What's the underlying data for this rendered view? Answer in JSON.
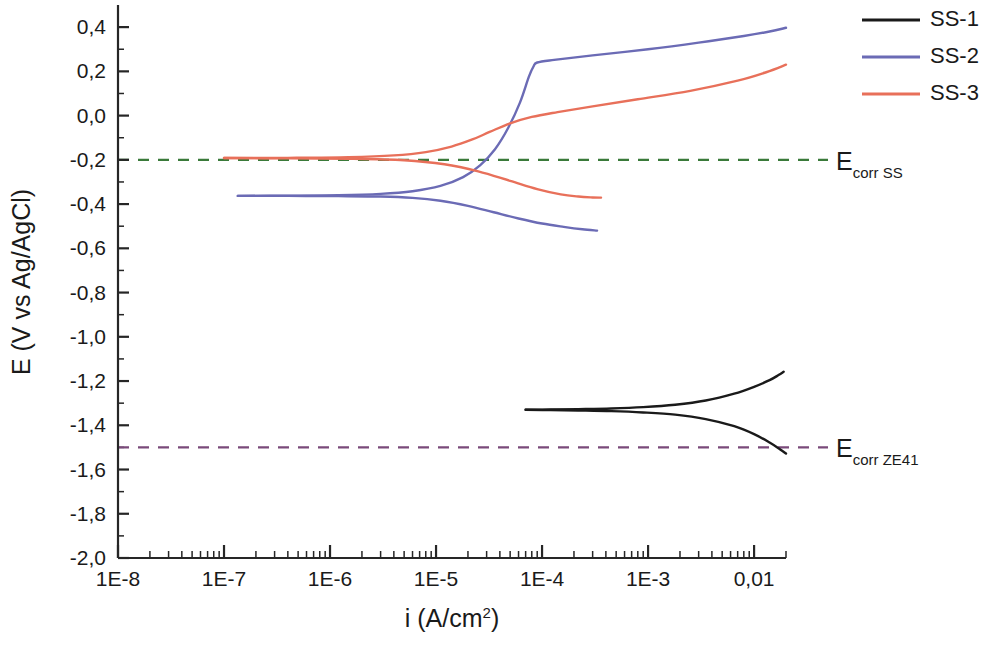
{
  "chart_data": {
    "type": "line",
    "title": "",
    "xlabel": "i (A/cm2)",
    "xlabel_base": "i (A/cm",
    "xlabel_sup": "2",
    "xlabel_tail": ")",
    "ylabel": "E (V vs Ag/AgCl)",
    "xscale": "log",
    "xlim": [
      1e-08,
      0.02
    ],
    "ylim": [
      -2.0,
      0.5
    ],
    "grid": false,
    "legend_position": "top-right",
    "x_tick_labels": [
      "1E-8",
      "1E-7",
      "1E-6",
      "1E-5",
      "1E-4",
      "1E-3",
      "0,01"
    ],
    "x_tick_values": [
      1e-08,
      1e-07,
      1e-06,
      1e-05,
      0.0001,
      0.001,
      0.01
    ],
    "y_tick_labels": [
      "0,4",
      "0,2",
      "0,0",
      "-0,2",
      "-0,4",
      "-0,6",
      "-0,8",
      "-1,0",
      "-1,2",
      "-1,4",
      "-1,6",
      "-1,8",
      "-2,0"
    ],
    "y_tick_values": [
      0.4,
      0.2,
      0.0,
      -0.2,
      -0.4,
      -0.6,
      -0.8,
      -1.0,
      -1.2,
      -1.4,
      -1.6,
      -1.8,
      -2.0
    ],
    "series": [
      {
        "name": "SS-1",
        "color": "#1a1a1a",
        "branch_cathodic": {
          "x": [
            7e-05,
            0.00012,
            0.00022,
            0.00045,
            0.0009,
            0.0018,
            0.0035,
            0.0065,
            0.01,
            0.014,
            0.0175,
            0.02
          ],
          "y": [
            -1.33,
            -1.331,
            -1.333,
            -1.336,
            -1.342,
            -1.352,
            -1.372,
            -1.404,
            -1.44,
            -1.478,
            -1.508,
            -1.528
          ]
        },
        "branch_anodic": {
          "x": [
            7e-05,
            0.00012,
            0.00022,
            0.00045,
            0.0009,
            0.0018,
            0.0035,
            0.0065,
            0.01,
            0.014,
            0.017,
            0.019
          ],
          "y": [
            -1.33,
            -1.329,
            -1.327,
            -1.324,
            -1.318,
            -1.307,
            -1.288,
            -1.257,
            -1.226,
            -1.196,
            -1.173,
            -1.158
          ]
        }
      },
      {
        "name": "SS-2",
        "color": "#6b6bb5",
        "branch_cathodic": {
          "x": [
            1.35e-07,
            4e-07,
            1.2e-06,
            3e-06,
            6e-06,
            1.1e-05,
            2e-05,
            3.5e-05,
            6e-05,
            0.0001,
            0.00016,
            0.00024,
            0.00033
          ],
          "y": [
            -0.363,
            -0.363,
            -0.364,
            -0.366,
            -0.372,
            -0.385,
            -0.408,
            -0.437,
            -0.465,
            -0.488,
            -0.503,
            -0.514,
            -0.52
          ]
        },
        "branch_anodic": {
          "x": [
            1.35e-07,
            4e-07,
            1.2e-06,
            3e-06,
            6e-06,
            1.1e-05,
            1.8e-05,
            2.6e-05,
            3.6e-05,
            4.8e-05,
            6.2e-05,
            7.5e-05,
            8.3e-05,
            9e-05,
            0.00013,
            0.0003,
            0.001,
            0.003,
            0.008,
            0.014,
            0.02
          ],
          "y": [
            -0.363,
            -0.362,
            -0.36,
            -0.354,
            -0.342,
            -0.318,
            -0.278,
            -0.225,
            -0.152,
            -0.055,
            0.06,
            0.175,
            0.222,
            0.24,
            0.252,
            0.272,
            0.3,
            0.33,
            0.36,
            0.38,
            0.397
          ]
        }
      },
      {
        "name": "SS-3",
        "color": "#e8705a",
        "branch_cathodic": {
          "x": [
            1e-07,
            4e-07,
            1.5e-06,
            5e-06,
            1.2e-05,
            2.5e-05,
            5e-05,
            9e-05,
            0.00015,
            0.00022,
            0.0003,
            0.00036
          ],
          "y": [
            -0.192,
            -0.193,
            -0.195,
            -0.202,
            -0.22,
            -0.252,
            -0.295,
            -0.332,
            -0.356,
            -0.366,
            -0.37,
            -0.371
          ]
        },
        "branch_anodic": {
          "x": [
            1e-07,
            4e-07,
            1.5e-06,
            4e-06,
            8e-06,
            1.4e-05,
            2.2e-05,
            3.2e-05,
            5e-05,
            8e-05,
            0.00014,
            0.0003,
            0.0008,
            0.0025,
            0.007,
            0.013,
            0.02
          ],
          "y": [
            -0.192,
            -0.191,
            -0.188,
            -0.18,
            -0.165,
            -0.14,
            -0.108,
            -0.074,
            -0.035,
            -0.006,
            0.016,
            0.042,
            0.074,
            0.112,
            0.158,
            0.196,
            0.23
          ]
        }
      }
    ],
    "reference_lines": [
      {
        "name": "Ecorr SS",
        "label_base": "E",
        "label_sub": "corr SS",
        "value": -0.2,
        "color": "#3a7a3a",
        "style": "dashed"
      },
      {
        "name": "Ecorr ZE41",
        "label_base": "E",
        "label_sub": "corr ZE41",
        "value": -1.5,
        "color": "#7a4a7a",
        "style": "dashed"
      }
    ],
    "legend": [
      {
        "label": "SS-1",
        "color": "#1a1a1a"
      },
      {
        "label": "SS-2",
        "color": "#6b6bb5"
      },
      {
        "label": "SS-3",
        "color": "#e8705a"
      }
    ]
  }
}
